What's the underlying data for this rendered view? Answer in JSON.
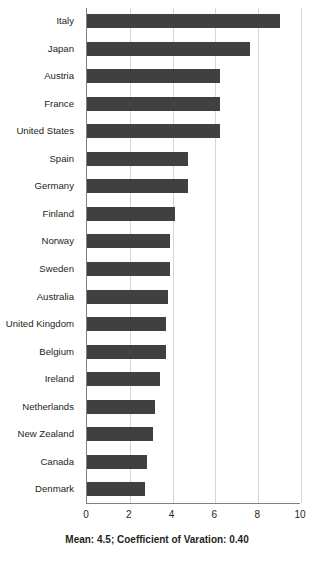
{
  "chart_data": {
    "type": "bar",
    "orientation": "horizontal",
    "title": "",
    "xlabel": "",
    "ylabel": "",
    "xlim": [
      0,
      10
    ],
    "xticks": [
      0,
      2,
      4,
      6,
      8,
      10
    ],
    "grid": "vertical",
    "legend": "none",
    "bar_color": "#404040",
    "gridline_color": "#d6d6d6",
    "axis_color": "#808080",
    "categories": [
      "Italy",
      "Japan",
      "Austria",
      "France",
      "United States",
      "Spain",
      "Germany",
      "Finland",
      "Norway",
      "Sweden",
      "Australia",
      "United Kingdom",
      "Belgium",
      "Ireland",
      "Netherlands",
      "New Zealand",
      "Canada",
      "Denmark"
    ],
    "values": [
      9.0,
      7.6,
      6.2,
      6.2,
      6.2,
      4.7,
      4.7,
      4.1,
      3.9,
      3.9,
      3.8,
      3.7,
      3.7,
      3.4,
      3.2,
      3.1,
      2.8,
      2.7
    ],
    "annotation": "Mean: 4.5; Coefficient of Varation:  0.40",
    "mean": 4.5,
    "coefficient_of_variation": 0.4
  }
}
